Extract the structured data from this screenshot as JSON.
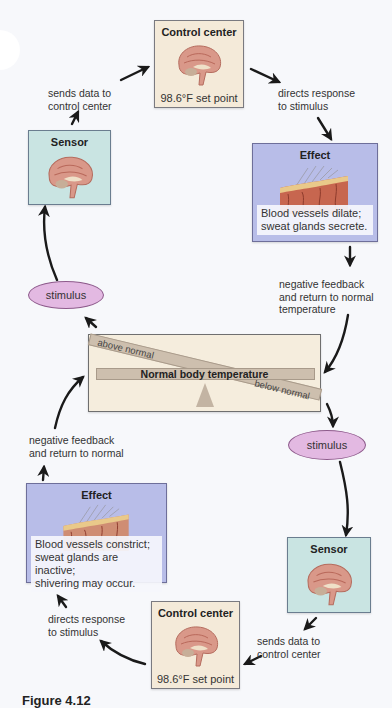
{
  "diagram": {
    "center": {
      "label": "Normal body temperature",
      "above_label": "above normal",
      "below_label": "below normal"
    },
    "top_loop": {
      "stimulus": "stimulus",
      "sensor": {
        "title": "Sensor"
      },
      "sensor_to_control": "sends data to control center",
      "sensor_to_control_lines": [
        "sends data to",
        "control center"
      ],
      "control_center": {
        "title": "Control center",
        "set_point": "98.6°F set point"
      },
      "control_to_effect_lines": [
        "directs response",
        "to stimulus"
      ],
      "effect": {
        "title": "Effect",
        "note_lines": [
          "Blood vessels dilate;",
          "sweat glands secrete."
        ]
      },
      "feedback_lines": [
        "negative feedback",
        "and return to normal",
        "temperature"
      ]
    },
    "bottom_loop": {
      "stimulus": "stimulus",
      "sensor": {
        "title": "Sensor"
      },
      "sensor_to_control_lines": [
        "sends data to",
        "control center"
      ],
      "control_center": {
        "title": "Control center",
        "set_point": "98.6°F set point"
      },
      "control_to_effect_lines": [
        "directs response",
        "to stimulus"
      ],
      "effect": {
        "title": "Effect",
        "note_lines": [
          "Blood vessels constrict;",
          "sweat glands are inactive;",
          "shivering may occur."
        ]
      },
      "feedback_lines": [
        "negative feedback",
        "and return to normal"
      ]
    },
    "caption": "Figure 4.12"
  },
  "colors": {
    "control_box": "#f4ead9",
    "sensor_box": "#c9e4e2",
    "effect_box": "#b8bde8",
    "stimulus_fill": "#e3b9e2",
    "arrow": "#1a1a1a"
  }
}
